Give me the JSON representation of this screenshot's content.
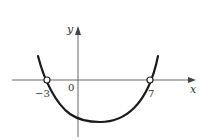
{
  "diagram": {
    "type": "function-graph",
    "axes": {
      "x_label": "x",
      "y_label": "y",
      "origin_label": "0"
    },
    "tick_labels": {
      "left_root": "−3",
      "right_root": "7"
    },
    "curve": {
      "shape": "U-shaped (concave up)",
      "x_intercepts": [
        -3,
        7
      ],
      "open_circles_at": [
        -3,
        7
      ],
      "extends_upward_beyond_intercepts": true,
      "minimum_below_x_axis": true,
      "color": "#1a1a1a"
    },
    "colors": {
      "axis": "#555555",
      "curve": "#1a1a1a",
      "background": "#ffffff"
    }
  }
}
